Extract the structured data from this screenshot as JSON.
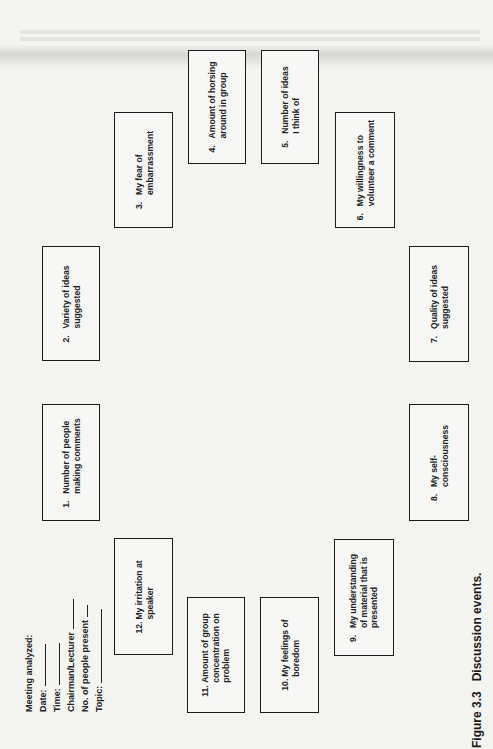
{
  "figure": {
    "label": "Figure 3.3",
    "title": "Discussion events."
  },
  "form": {
    "heading": "Meeting analyzed:",
    "fields": [
      {
        "label": "Date:"
      },
      {
        "label": "Time:"
      },
      {
        "label": "Chairman/Lecturer"
      },
      {
        "label": "No. of people present"
      },
      {
        "label": "Topic:"
      }
    ]
  },
  "events": [
    {
      "num": "1.",
      "line1": "Number of people",
      "line2": "making comments"
    },
    {
      "num": "2.",
      "line1": "Variety of ideas",
      "line2": "suggested"
    },
    {
      "num": "3.",
      "line1": "My fear of",
      "line2": "embarrassment"
    },
    {
      "num": "4.",
      "line1": "Amount of horsing",
      "line2": "around in group"
    },
    {
      "num": "5.",
      "line1": "Number of ideas",
      "line2": "I think of"
    },
    {
      "num": "6.",
      "line1": "My willingness to",
      "line2": "volunteer a comment"
    },
    {
      "num": "7.",
      "line1": "Quality of ideas",
      "line2": "suggested"
    },
    {
      "num": "8.",
      "line1": "My self-",
      "line2": "consciousness"
    },
    {
      "num": "9.",
      "line1": "My understanding",
      "line2": "of material that is",
      "line3": "presented"
    },
    {
      "num": "10.",
      "line1": "My feelings of",
      "line2": "boredom"
    },
    {
      "num": "11.",
      "line1": "Amount of group",
      "line2": "concentration on",
      "line3": "problem"
    },
    {
      "num": "12.",
      "line1": "My irritation at",
      "line2": "speaker"
    }
  ]
}
